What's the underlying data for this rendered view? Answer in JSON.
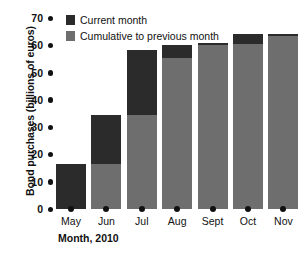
{
  "chart_data": {
    "type": "bar",
    "stacked": true,
    "title": "",
    "xlabel": "Month, 2010",
    "ylabel": "Bond purchases (billions of euros)",
    "categories": [
      "May",
      "Jun",
      "Jul",
      "Aug",
      "Sept",
      "Oct",
      "Nov"
    ],
    "ylim": [
      0,
      70
    ],
    "yticks": [
      0,
      10,
      20,
      30,
      40,
      50,
      60,
      70
    ],
    "ytick_labels": [
      "0",
      "10",
      "20",
      "30",
      "40",
      "50",
      "60",
      "70"
    ],
    "grid": false,
    "legend_position": "top-left",
    "series": [
      {
        "name": "Cumulative to previous month",
        "color": "#6e6e6e",
        "values": [
          0,
          16.5,
          34.3,
          55.5,
          60.2,
          60.5,
          63.5
        ]
      },
      {
        "name": "Current month",
        "color": "#2b2b2b",
        "values": [
          16.5,
          17.8,
          24.0,
          4.5,
          0.5,
          3.5,
          0.5
        ]
      }
    ],
    "totals": [
      16.5,
      34.3,
      58.3,
      60.0,
      60.7,
      64.0,
      64.0
    ]
  },
  "legend": {
    "items": [
      {
        "label": "Current month",
        "color": "#2b2b2b"
      },
      {
        "label": "Cumulative to previous month",
        "color": "#6e6e6e"
      }
    ]
  },
  "axes": {
    "y_title": "Bond purchases (billions of euros)",
    "x_title": "Month, 2010"
  }
}
